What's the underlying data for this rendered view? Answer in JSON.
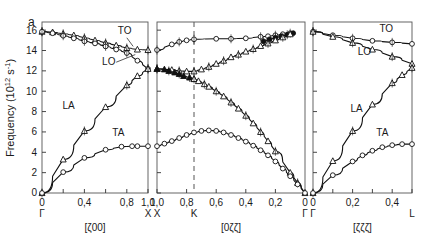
{
  "figure": {
    "panel_label": "a",
    "ylabel": "Frequency (10",
    "ylabel_sup": "12",
    "ylabel_tail": " s",
    "ylabel_sup2": "-1",
    "ylabel_end": ")"
  },
  "chart_data": {
    "type": "line",
    "title": "",
    "ylabel": "Frequency (10^12 s^-1)",
    "ylim": [
      0,
      16.8
    ],
    "yticks": [
      0,
      2,
      4,
      6,
      8,
      10,
      12,
      14,
      16
    ],
    "ytick_labels": [
      "0",
      "2",
      "4",
      "6",
      "8",
      "10",
      "12",
      "14",
      "16"
    ],
    "grid": false,
    "legend": "inline branch labels",
    "marker_legend": {
      "open_circle": "transverse / measured open symbol",
      "open_triangle": "longitudinal / measured open symbol",
      "filled_circle": "filled circle data",
      "filled_triangle": "filled triangle data"
    },
    "panels": [
      {
        "name": "panel-1",
        "xlabel": "[ζ00]",
        "xlim": [
          0,
          1.0
        ],
        "xticks": [
          0,
          0.2,
          0.4,
          0.6,
          0.8,
          1.0
        ],
        "xtick_labels": [
          "0",
          "",
          "0,4",
          "",
          "0,8",
          "1,0"
        ],
        "xtick_labeled": [
          0,
          0.4,
          0.8,
          1.0
        ],
        "symmetry_points": [
          {
            "label": "Γ",
            "x": 0
          },
          {
            "label": "X",
            "x": 1.0
          }
        ],
        "branch_labels": [
          {
            "label": "TO",
            "x": 0.78,
            "y": 15.6
          },
          {
            "label": "LO",
            "x": 0.63,
            "y": 12.6
          },
          {
            "label": "LA",
            "x": 0.25,
            "y": 8.3
          },
          {
            "label": "TA",
            "x": 0.72,
            "y": 5.6
          }
        ],
        "series": [
          {
            "name": "TO",
            "marker": "open_triangle",
            "x": [
              0,
              0.1,
              0.2,
              0.3,
              0.4,
              0.5,
              0.6,
              0.7,
              0.8,
              0.9,
              1.0
            ],
            "y": [
              15.85,
              15.8,
              15.65,
              15.5,
              15.25,
              15.0,
              14.75,
              14.5,
              14.25,
              14.1,
              14.05
            ]
          },
          {
            "name": "LO",
            "marker": "open_circle",
            "x": [
              0,
              0.1,
              0.2,
              0.3,
              0.4,
              0.5,
              0.6,
              0.7,
              0.8,
              0.9,
              1.0
            ],
            "y": [
              15.85,
              15.7,
              15.45,
              15.2,
              14.9,
              14.7,
              14.4,
              14.1,
              13.75,
              13.0,
              12.2
            ]
          },
          {
            "name": "LA",
            "marker": "open_triangle",
            "x": [
              0,
              0.2,
              0.4,
              0.6,
              0.8,
              0.9,
              1.0
            ],
            "y": [
              0,
              3.3,
              6.1,
              8.45,
              10.6,
              11.5,
              12.2
            ]
          },
          {
            "name": "TA",
            "marker": "open_circle",
            "x": [
              0,
              0.2,
              0.4,
              0.6,
              0.75,
              0.85,
              0.9,
              1.0
            ],
            "y": [
              0,
              2.05,
              3.45,
              4.25,
              4.55,
              4.6,
              4.6,
              4.6
            ]
          }
        ]
      },
      {
        "name": "panel-2",
        "xlabel": "[0ζζ]",
        "xlim": [
          1.0,
          0
        ],
        "xticks": [
          1.0,
          0.8,
          0.6,
          0.4,
          0.2,
          0
        ],
        "xtick_labels": [
          "1,0",
          "0,8",
          "0,6",
          "0,4",
          "0,2",
          "0"
        ],
        "symmetry_points": [
          {
            "label": "X",
            "x": 1.0
          },
          {
            "label": "K",
            "x": 0.75
          },
          {
            "label": "Γ",
            "x": 0
          }
        ],
        "dashed_line_x": 0.75,
        "branch_labels": [],
        "series": [
          {
            "name": "TO-upper",
            "marker": "open_circle",
            "x": [
              1.0,
              0.9,
              0.85,
              0.8,
              0.75,
              0.6,
              0.5,
              0.4,
              0.3,
              0.25,
              0.2,
              0.15,
              0.1
            ],
            "y": [
              14.05,
              14.6,
              14.85,
              15.0,
              15.1,
              15.15,
              15.15,
              15.2,
              15.35,
              15.4,
              15.5,
              15.6,
              15.7
            ]
          },
          {
            "name": "LO-filled",
            "marker": "filled_circle",
            "x": [
              0.28,
              0.24,
              0.2,
              0.16,
              0.12,
              0.08
            ],
            "y": [
              14.9,
              15.1,
              15.25,
              15.4,
              15.55,
              15.7
            ]
          },
          {
            "name": "LO-mid",
            "marker": "open_triangle",
            "x": [
              1.0,
              0.9,
              0.85,
              0.8,
              0.75,
              0.7,
              0.65,
              0.6,
              0.55,
              0.5,
              0.45,
              0.4,
              0.35,
              0.3,
              0.25,
              0.2,
              0.15,
              0.1
            ],
            "y": [
              12.2,
              12.1,
              12.0,
              11.95,
              11.95,
              12.15,
              12.4,
              12.7,
              13.0,
              13.35,
              13.6,
              13.9,
              14.15,
              14.45,
              14.7,
              15.0,
              15.3,
              15.6
            ]
          },
          {
            "name": "LA-filled",
            "marker": "filled_triangle",
            "x": [
              1.0,
              0.95,
              0.92,
              0.88,
              0.85,
              0.82,
              0.78,
              0.75
            ],
            "y": [
              12.2,
              12.15,
              12.0,
              11.85,
              11.7,
              11.5,
              11.35,
              11.2
            ]
          },
          {
            "name": "LA",
            "marker": "open_triangle",
            "x": [
              0.75,
              0.72,
              0.68,
              0.65,
              0.6,
              0.55,
              0.5,
              0.45,
              0.4,
              0.35,
              0.3,
              0.25,
              0.2,
              0.1,
              0.05,
              0
            ],
            "y": [
              11.2,
              11.0,
              10.7,
              10.45,
              10.0,
              9.5,
              8.9,
              8.3,
              7.6,
              6.85,
              6.0,
              5.1,
              4.1,
              2.0,
              1.0,
              0
            ]
          },
          {
            "name": "TA",
            "marker": "open_circle",
            "x": [
              1.0,
              0.95,
              0.9,
              0.85,
              0.8,
              0.75,
              0.7,
              0.65,
              0.6,
              0.55,
              0.5,
              0.45,
              0.4,
              0.35,
              0.3,
              0.25,
              0.2,
              0.15,
              0.1,
              0.05,
              0
            ],
            "y": [
              4.6,
              4.85,
              5.1,
              5.4,
              5.7,
              5.95,
              6.1,
              6.15,
              6.1,
              5.95,
              5.7,
              5.4,
              5.05,
              4.65,
              4.2,
              3.7,
              3.1,
              2.4,
              1.65,
              0.85,
              0
            ]
          }
        ]
      },
      {
        "name": "panel-3",
        "xlabel": "[ζζζ]",
        "xlim": [
          0,
          0.5
        ],
        "xticks": [
          0,
          0.1,
          0.2,
          0.3,
          0.4,
          0.5
        ],
        "xtick_labels": [
          "0",
          "",
          "0,2",
          "",
          "0,4",
          ""
        ],
        "symmetry_points": [
          {
            "label": "Γ",
            "x": 0
          },
          {
            "label": "L",
            "x": 0.5
          }
        ],
        "branch_labels": [
          {
            "label": "TO",
            "x": 0.37,
            "y": 15.8
          },
          {
            "label": "LO",
            "x": 0.26,
            "y": 13.6
          },
          {
            "label": "LA",
            "x": 0.22,
            "y": 8.0
          },
          {
            "label": "TA",
            "x": 0.35,
            "y": 5.6
          }
        ],
        "series": [
          {
            "name": "TO",
            "marker": "open_circle",
            "x": [
              0,
              0.1,
              0.2,
              0.3,
              0.4,
              0.5
            ],
            "y": [
              15.85,
              15.5,
              15.2,
              14.95,
              14.8,
              14.65
            ]
          },
          {
            "name": "LO",
            "marker": "open_triangle",
            "x": [
              0,
              0.1,
              0.2,
              0.3,
              0.4,
              0.5
            ],
            "y": [
              15.85,
              15.35,
              14.75,
              14.1,
              13.4,
              12.7
            ]
          },
          {
            "name": "LA",
            "marker": "open_triangle",
            "x": [
              0,
              0.1,
              0.2,
              0.3,
              0.4,
              0.45,
              0.5
            ],
            "y": [
              0,
              3.15,
              6.1,
              8.7,
              10.8,
              11.6,
              12.3
            ]
          },
          {
            "name": "TA",
            "marker": "open_circle",
            "x": [
              0,
              0.1,
              0.2,
              0.25,
              0.3,
              0.35,
              0.4,
              0.45,
              0.5
            ],
            "y": [
              0,
              1.75,
              3.1,
              3.7,
              4.15,
              4.5,
              4.7,
              4.8,
              4.8
            ]
          }
        ]
      }
    ]
  }
}
